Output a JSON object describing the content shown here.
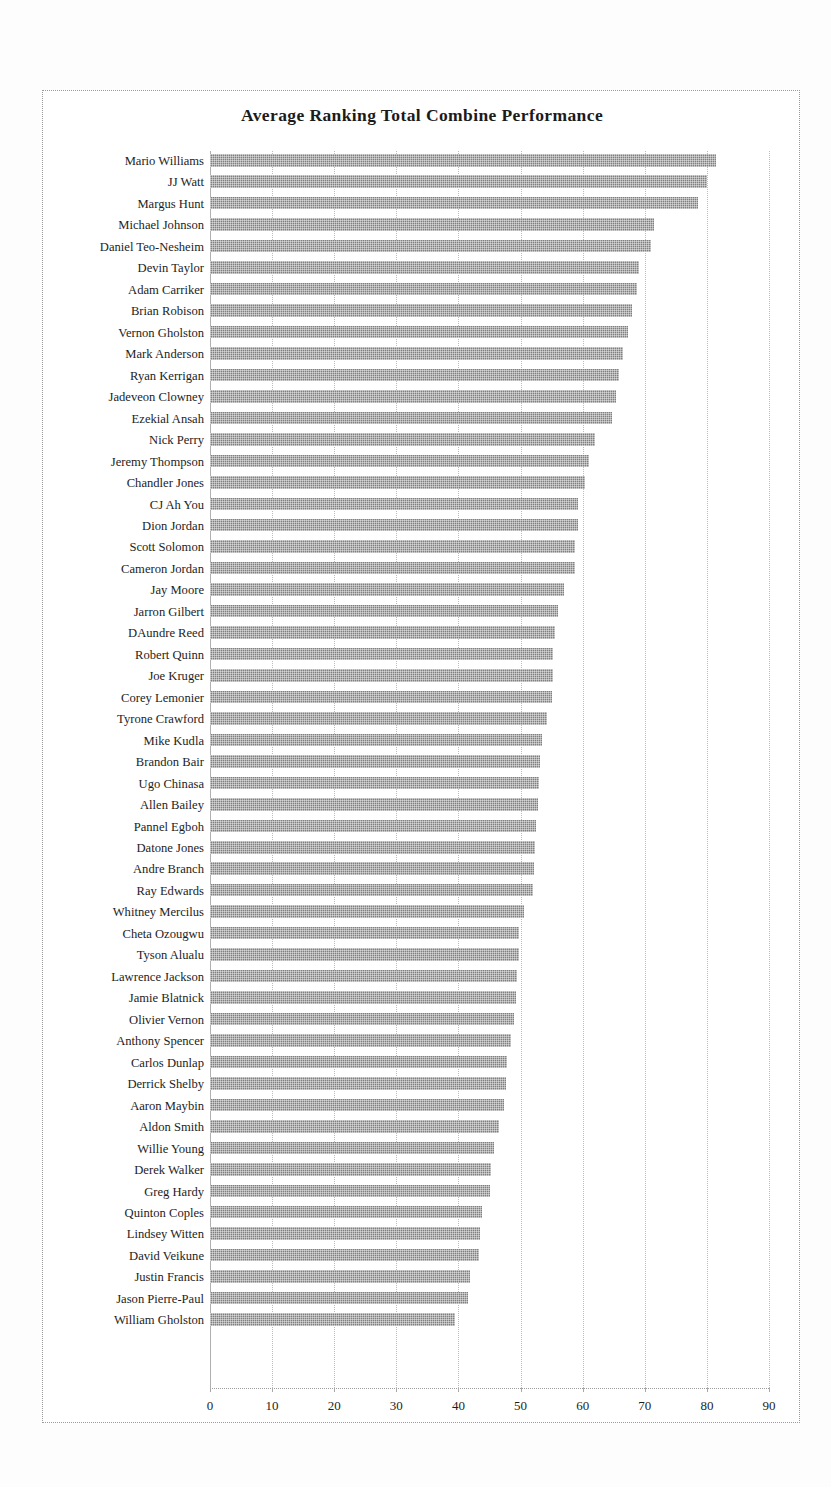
{
  "chart_data": {
    "type": "bar",
    "orientation": "horizontal",
    "title": "Average Ranking Total Combine Performance",
    "xlabel": "",
    "ylabel": "",
    "xlim": [
      0,
      90
    ],
    "xticks": [
      0,
      10,
      20,
      30,
      40,
      50,
      60,
      70,
      80,
      90
    ],
    "grid": true,
    "legend": false,
    "bar_color": "#808080",
    "categories": [
      "Mario Williams",
      "JJ Watt",
      "Margus Hunt",
      "Michael Johnson",
      "Daniel Teo-Nesheim",
      "Devin Taylor",
      "Adam Carriker",
      "Brian Robison",
      "Vernon Gholston",
      "Mark Anderson",
      "Ryan Kerrigan",
      "Jadeveon Clowney",
      "Ezekial Ansah",
      "Nick Perry",
      "Jeremy Thompson",
      "Chandler Jones",
      "CJ Ah You",
      "Dion Jordan",
      "Scott Solomon",
      "Cameron Jordan",
      "Jay Moore",
      "Jarron Gilbert",
      "DAundre Reed",
      "Robert Quinn",
      "Joe Kruger",
      "Corey Lemonier",
      "Tyrone Crawford",
      "Mike Kudla",
      "Brandon Bair",
      "Ugo Chinasa",
      "Allen Bailey",
      "Pannel Egboh",
      "Datone Jones",
      "Andre Branch",
      "Ray Edwards",
      "Whitney Mercilus",
      "Cheta Ozougwu",
      "Tyson Alualu",
      "Lawrence Jackson",
      "Jamie Blatnick",
      "Olivier Vernon",
      "Anthony Spencer",
      "Carlos Dunlap",
      "Derrick Shelby",
      "Aaron Maybin",
      "Aldon Smith",
      "Willie Young",
      "Derek Walker",
      "Greg Hardy",
      "Quinton Coples",
      "Lindsey Witten",
      "David Veikune",
      "Justin Francis",
      "Jason Pierre-Paul",
      "William Gholston"
    ],
    "values": [
      81.5,
      80.0,
      78.5,
      71.5,
      71.0,
      69.0,
      68.8,
      68.0,
      67.3,
      66.5,
      65.8,
      65.3,
      64.8,
      62.0,
      61.0,
      60.3,
      59.3,
      59.3,
      58.8,
      58.8,
      57.0,
      56.0,
      55.5,
      55.2,
      55.2,
      55.0,
      54.3,
      53.5,
      53.2,
      53.0,
      52.8,
      52.5,
      52.3,
      52.2,
      52.0,
      50.5,
      49.8,
      49.8,
      49.5,
      49.3,
      49.0,
      48.5,
      47.8,
      47.6,
      47.3,
      46.5,
      45.8,
      45.3,
      45.0,
      43.8,
      43.5,
      43.3,
      41.8,
      41.6,
      39.5
    ]
  }
}
